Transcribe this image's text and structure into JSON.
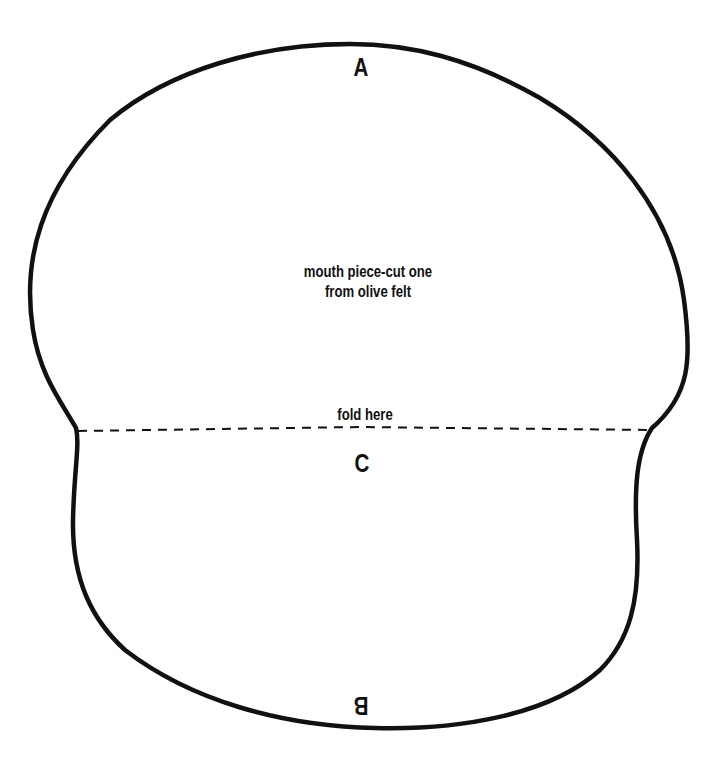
{
  "pattern": {
    "title": "mouth piece pattern",
    "instructions": {
      "line1": "mouth piece-cut one",
      "line2": "from olive felt"
    },
    "fold": {
      "label": "fold here",
      "style": "dashed"
    },
    "points": {
      "top": "A",
      "middle": "C",
      "bottom": "B"
    },
    "colors": {
      "line": "#111111",
      "background": "#ffffff"
    }
  }
}
